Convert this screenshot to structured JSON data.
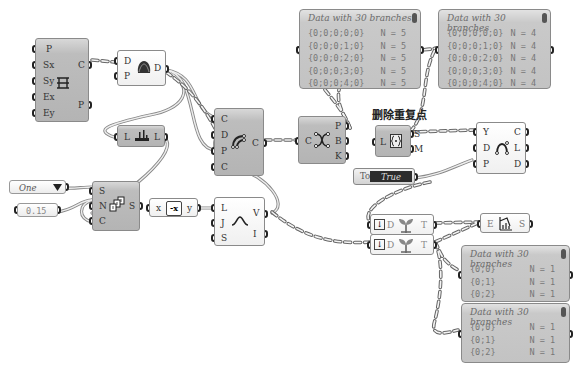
{
  "canvas": {
    "background": "#ffffff",
    "wire_color": "#7a7a7a"
  },
  "annotation": {
    "label": "删除重复点"
  },
  "nodes": {
    "grid": {
      "inputs": [
        "P",
        "Sx",
        "Sy",
        "Ex",
        "Ey"
      ],
      "outputs": [
        "C",
        "P"
      ],
      "icon": "rectangular-grid-icon"
    },
    "jitter": {
      "inputs": [
        "D",
        "P"
      ],
      "outputs": [
        "D"
      ],
      "icon": "shape-blob-icon"
    },
    "list_length": {
      "inputs": [
        "L"
      ],
      "outputs": [
        "L"
      ],
      "icon": "list-item-icon"
    },
    "closed_curve": {
      "inputs": [
        "C",
        "D",
        "P",
        "C"
      ],
      "outputs": [
        "C"
      ],
      "icon": "curve-arc-icon"
    },
    "end_points": {
      "inputs": [
        "C"
      ],
      "outputs": [
        "P",
        "B",
        "K"
      ],
      "icon": "curve-endpoints-icon"
    },
    "cull_duplicates": {
      "inputs": [
        "L"
      ],
      "outputs": [
        "S",
        "M"
      ],
      "icon": "cull-duplicates-icon"
    },
    "boolean_toggle": {
      "label": "Toggle",
      "value": "True"
    },
    "interpolate": {
      "inputs": [
        "Y",
        "D",
        "P"
      ],
      "outputs": [
        "C",
        "L",
        "D"
      ],
      "icon": "interpolate-curve-icon"
    },
    "value_list": {
      "value": "One"
    },
    "number_slider": {
      "value": "0.15"
    },
    "series": {
      "inputs": [
        "S",
        "N",
        "C"
      ],
      "outputs": [
        "S"
      ],
      "icon": "series-icon"
    },
    "negative": {
      "input": "x",
      "output": "y",
      "icon_text": "-x"
    },
    "graph_mapper": {
      "inputs": [
        "L",
        "J",
        "S"
      ],
      "outputs": [
        "V",
        "I"
      ],
      "icon": "bell-curve-icon"
    },
    "simplify_tree_1": {
      "inputs": [
        "D"
      ],
      "outputs": [
        "T"
      ],
      "icon": "sprout-icon"
    },
    "simplify_tree_2": {
      "inputs": [
        "D"
      ],
      "outputs": [
        "T"
      ],
      "icon": "sprout-icon"
    },
    "tree_statistics": {
      "inputs": [
        "E"
      ],
      "outputs": [
        "S"
      ],
      "icon": "tree-stat-icon"
    }
  },
  "panels": [
    {
      "title": "Data with 30 branches",
      "rows": [
        {
          "path": "{0;0;0;0;0}",
          "count": "N = 5"
        },
        {
          "path": "{0;0;0;1;0}",
          "count": "N = 5"
        },
        {
          "path": "{0;0;0;2;0}",
          "count": "N = 5"
        },
        {
          "path": "{0;0;0;3;0}",
          "count": "N = 5"
        },
        {
          "path": "{0;0;0;4;0}",
          "count": "N = 5"
        }
      ]
    },
    {
      "title": "Data with 30 branches",
      "rows": [
        {
          "path": "{0;0;0;0;0}",
          "count": "N = 4"
        },
        {
          "path": "{0;0;0;1;0}",
          "count": "N = 4"
        },
        {
          "path": "{0;0;0;2;0}",
          "count": "N = 4"
        },
        {
          "path": "{0;0;0;3;0}",
          "count": "N = 4"
        },
        {
          "path": "{0;0;0;4;0}",
          "count": "N = 4"
        }
      ]
    },
    {
      "title": "Data with 30 branches",
      "rows": [
        {
          "path": "{0;0}",
          "count": "N = 1"
        },
        {
          "path": "{0;1}",
          "count": "N = 1"
        },
        {
          "path": "{0;2}",
          "count": "N = 1"
        }
      ]
    },
    {
      "title": "Data with 30 branches",
      "rows": [
        {
          "path": "{0;0}",
          "count": "N = 1"
        },
        {
          "path": "{0;1}",
          "count": "N = 1"
        },
        {
          "path": "{0;2}",
          "count": "N = 1"
        }
      ]
    }
  ]
}
